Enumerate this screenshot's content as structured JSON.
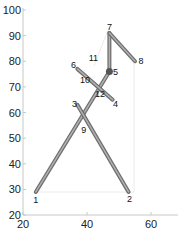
{
  "chart_data": {
    "type": "line",
    "title": "",
    "xlabel": "",
    "ylabel": "",
    "xlim": [
      20,
      68
    ],
    "ylim": [
      20,
      100
    ],
    "x_ticks": [
      "20",
      "40",
      "60"
    ],
    "y_ticks": [
      "20",
      "30",
      "40",
      "50",
      "60",
      "70",
      "80",
      "90",
      "100"
    ],
    "grid": false,
    "legend": null,
    "joints": [
      {
        "id": "1",
        "x": 24,
        "y": 29
      },
      {
        "id": "2",
        "x": 53,
        "y": 29
      },
      {
        "id": "3",
        "x": 37,
        "y": 63
      },
      {
        "id": "4",
        "x": 48,
        "y": 65
      },
      {
        "id": "5",
        "x": 47,
        "y": 76
      },
      {
        "id": "6",
        "x": 37,
        "y": 77
      },
      {
        "id": "7",
        "x": 47,
        "y": 91
      },
      {
        "id": "8",
        "x": 55,
        "y": 80
      },
      {
        "id": "9",
        "x": 39,
        "y": 57
      },
      {
        "id": "10",
        "x": 40,
        "y": 73
      },
      {
        "id": "11",
        "x": 42,
        "y": 78
      },
      {
        "id": "12",
        "x": 45,
        "y": 68
      }
    ],
    "segments": [
      [
        "1",
        "5"
      ],
      [
        "3",
        "2"
      ],
      [
        "6",
        "4"
      ],
      [
        "5",
        "7"
      ],
      [
        "7",
        "8"
      ]
    ],
    "line_color": "#8a8a8a",
    "joint_marker_color": "#555555"
  }
}
